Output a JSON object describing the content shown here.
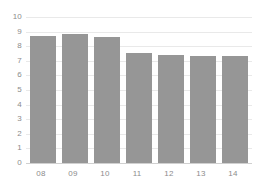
{
  "chart_data": {
    "type": "bar",
    "title": "",
    "subtitle": "",
    "xlabel": "",
    "ylabel": "",
    "categories": [
      "08",
      "09",
      "10",
      "11",
      "12",
      "13",
      "14"
    ],
    "values": [
      8.7,
      8.85,
      8.6,
      7.55,
      7.4,
      7.35,
      7.35
    ],
    "series": [
      {
        "name": "",
        "values": [
          8.7,
          8.85,
          8.6,
          7.55,
          7.4,
          7.35,
          7.35
        ]
      }
    ],
    "ylim": [
      0,
      10
    ],
    "y_ticks": [
      0,
      1,
      2,
      3,
      4,
      5,
      6,
      7,
      8,
      9,
      10
    ],
    "y_tick_labels": [
      "0",
      "1",
      "2",
      "3",
      "4",
      "5",
      "6",
      "7",
      "8",
      "9",
      "10"
    ],
    "x_tick_labels": [
      "08",
      "09",
      "10",
      "11",
      "12",
      "13",
      "14"
    ],
    "grid": true,
    "grid_axis": "y",
    "legend": false,
    "legend_position": "none",
    "annotations": [],
    "colors": {
      "bar": "#969696",
      "gridline": "#e9e9e9",
      "baseline": "#d0d0d0",
      "tick_label": "#8c8c8c",
      "background": "#ffffff"
    }
  }
}
